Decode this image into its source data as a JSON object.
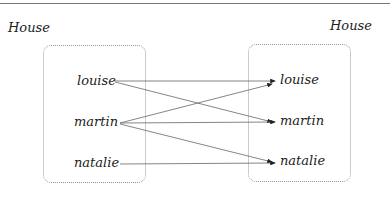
{
  "diagram": {
    "left_title": "House",
    "right_title": "House",
    "left_items": [
      "louise",
      "martin",
      "natalie"
    ],
    "right_items": [
      "louise",
      "martin",
      "natalie"
    ],
    "mappings": [
      {
        "from": "louise",
        "to": "louise"
      },
      {
        "from": "louise",
        "to": "martin"
      },
      {
        "from": "martin",
        "to": "louise"
      },
      {
        "from": "martin",
        "to": "martin"
      },
      {
        "from": "martin",
        "to": "natalie"
      },
      {
        "from": "natalie",
        "to": "natalie"
      }
    ]
  }
}
